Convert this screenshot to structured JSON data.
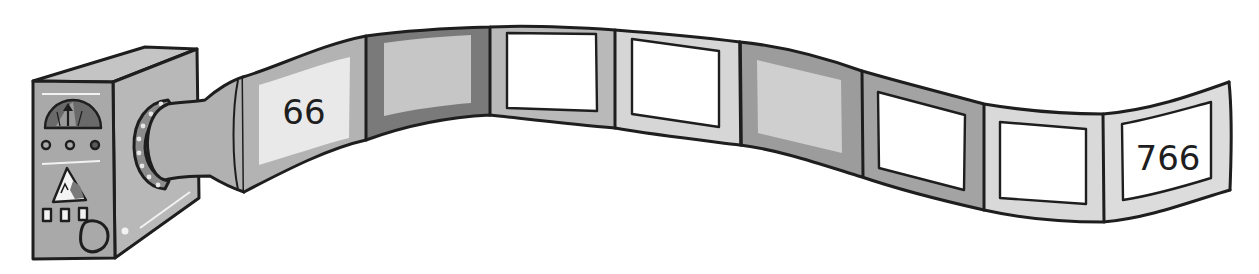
{
  "illustration": {
    "description": "Number machine outputting a wavy strip of frames",
    "machine": {
      "gauge_icon": "gauge-dial-icon",
      "indicator_lights": 3,
      "warning_icon": "triangle-icon",
      "buttons": 3,
      "knob_icon": "round-knob-icon"
    },
    "strip": {
      "frames": [
        {
          "label": "66",
          "border": "#b3b3b3",
          "inner": "#e9e9e9",
          "outlined": false
        },
        {
          "label": "",
          "border": "#7a7a7a",
          "inner": "#c6c6c6",
          "outlined": false
        },
        {
          "label": "",
          "border": "#b9b9b9",
          "inner": "#ffffff",
          "outlined": true
        },
        {
          "label": "",
          "border": "#d6d6d6",
          "inner": "#ffffff",
          "outlined": true
        },
        {
          "label": "",
          "border": "#9c9c9c",
          "inner": "#cfcfcf",
          "outlined": false
        },
        {
          "label": "",
          "border": "#a3a3a3",
          "inner": "#ffffff",
          "outlined": true
        },
        {
          "label": "",
          "border": "#d9d9d9",
          "inner": "#ffffff",
          "outlined": true
        },
        {
          "label": "766",
          "border": "#dcdcdc",
          "inner": "#ffffff",
          "outlined": true
        }
      ]
    },
    "colors": {
      "machine_front": "#a9a9a9",
      "machine_side": "#b8b8b8",
      "machine_top": "#c4c4c4",
      "outline": "#1e1e1e"
    }
  }
}
